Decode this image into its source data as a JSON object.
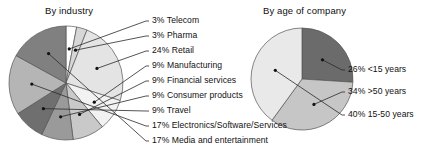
{
  "chart_data": [
    {
      "type": "pie",
      "title": "By industry",
      "xlabel": "",
      "ylabel": "",
      "legend_position": "right-callout",
      "grid": false,
      "categories": [
        "Telecom",
        "Pharma",
        "Retail",
        "Manufacturing",
        "Financial services",
        "Consumer products",
        "Travel",
        "Electronics/Software/Services",
        "Media and entertainment"
      ],
      "values": [
        3,
        3,
        24,
        9,
        9,
        9,
        9,
        17,
        17
      ],
      "unit": "%",
      "slices": [
        {
          "label": "3% Telecom",
          "category": "Telecom",
          "value": 3,
          "color": "#ffffff",
          "callout_y": 25
        },
        {
          "label": "3% Pharma",
          "category": "Pharma",
          "value": 3,
          "color": "#d7d7d7",
          "callout_y": 40
        },
        {
          "label": "24% Retail",
          "category": "Retail",
          "value": 24,
          "color": "#e4e4e4",
          "callout_y": 55
        },
        {
          "label": "9% Manufacturing",
          "category": "Manufacturing",
          "value": 9,
          "color": "#f2f2f2",
          "callout_y": 70
        },
        {
          "label": "9% Financial services",
          "category": "Financial services",
          "value": 9,
          "color": "#c9c9c9",
          "callout_y": 85
        },
        {
          "label": "9% Consumer products",
          "category": "Consumer products",
          "value": 9,
          "color": "#9a9a9a",
          "callout_y": 100
        },
        {
          "label": "9% Travel",
          "category": "Travel",
          "value": 9,
          "color": "#6f6f6f",
          "callout_y": 115
        },
        {
          "label": "17% Electronics/Software/Services",
          "category": "Electronics/Software/Services",
          "value": 17,
          "color": "#b5b5b5",
          "callout_y": 130
        },
        {
          "label": "17% Media and entertainment",
          "category": "Media and entertainment",
          "value": 17,
          "color": "#808080",
          "callout_y": 145
        }
      ]
    },
    {
      "type": "pie",
      "title": "By age of company",
      "xlabel": "",
      "ylabel": "",
      "legend_position": "right-callout",
      "grid": false,
      "categories": [
        "<15 years",
        ">50 years",
        "15-50 years"
      ],
      "values": [
        26,
        34,
        40
      ],
      "unit": "%",
      "slices": [
        {
          "label": "26% <15 years",
          "category": "<15 years",
          "value": 26,
          "color": "#6b6b6b",
          "callout_y": 74
        },
        {
          "label": "34% >50 years",
          "category": ">50 years",
          "value": 34,
          "color": "#c6c6c6",
          "callout_y": 96
        },
        {
          "label": "40% 15-50 years",
          "category": "15-50 years",
          "value": 40,
          "color": "#e9e9e9",
          "callout_y": 119
        }
      ]
    }
  ]
}
